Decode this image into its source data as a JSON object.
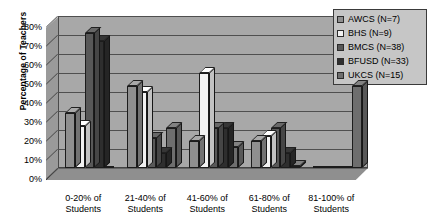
{
  "chart_data": {
    "type": "bar",
    "title": "",
    "subtitle": "",
    "xlabel": "",
    "ylabel": "Percentage of Teachers",
    "ylim": [
      0,
      80
    ],
    "ytick_labels": [
      "80%",
      "70%",
      "60%",
      "50%",
      "40%",
      "30%",
      "20%",
      "10%",
      "0%"
    ],
    "ytick_values": [
      80,
      70,
      60,
      50,
      40,
      30,
      20,
      10,
      0
    ],
    "grid": true,
    "grid_axis": "y",
    "legend_position": "right",
    "style": "3d-clustered-column-grayscale",
    "categories": [
      "0-20% of Students",
      "21-40% of Students",
      "41-60% of Students",
      "61-80% of Students",
      "81-100% of Students"
    ],
    "series": [
      {
        "name": "AWCS (N=7)",
        "color": "#8f8f8f",
        "values": [
          29,
          43,
          14,
          14,
          0
        ]
      },
      {
        "name": "BHS (N=9)",
        "color": "#f2f2f2",
        "values": [
          22,
          40,
          50,
          17,
          0
        ]
      },
      {
        "name": "BMCS (N=38)",
        "color": "#585858",
        "values": [
          71,
          16,
          21,
          21,
          0
        ]
      },
      {
        "name": "BFUSD (N=33)",
        "color": "#2e2e2e",
        "values": [
          67,
          8,
          21,
          8,
          0
        ]
      },
      {
        "name": "UKCS (N=15)",
        "color": "#6e6e6e",
        "values": [
          0,
          21,
          11,
          1,
          43
        ]
      }
    ]
  },
  "legend": {
    "items": [
      {
        "label": "AWCS (N=7)",
        "color": "#8f8f8f"
      },
      {
        "label": "BHS (N=9)",
        "color": "#f2f2f2"
      },
      {
        "label": "BMCS (N=38)",
        "color": "#585858"
      },
      {
        "label": "BFUSD (N=33)",
        "color": "#2e2e2e"
      },
      {
        "label": "UKCS (N=15)",
        "color": "#6e6e6e"
      }
    ]
  }
}
